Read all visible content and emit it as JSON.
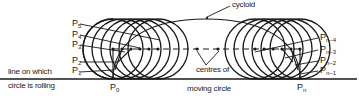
{
  "labels": {
    "cycloid": "cycloid",
    "centres_line1": "centres of",
    "centres_line2": "moving circle",
    "rolling_line1": "line on which",
    "rolling_line2": "circle is rolling"
  },
  "points_left": [
    {
      "base": "P",
      "sub": "5"
    },
    {
      "base": "P",
      "sub": "4"
    },
    {
      "base": "P",
      "sub": "3"
    },
    {
      "base": "P",
      "sub": "2"
    },
    {
      "base": "P",
      "sub": "1"
    }
  ],
  "points_right": [
    {
      "base": "P",
      "sub": "n−4"
    },
    {
      "base": "P",
      "sub": "n−3"
    },
    {
      "base": "P",
      "sub": "n−2"
    },
    {
      "base": "P",
      "sub": "n−1"
    }
  ],
  "start_point": {
    "base": "P",
    "sub": "0"
  },
  "end_point": {
    "base": "P",
    "sub": "n"
  },
  "colors": {
    "line": "#1a1a1a",
    "text": "#222222",
    "background": "#ffffff"
  }
}
